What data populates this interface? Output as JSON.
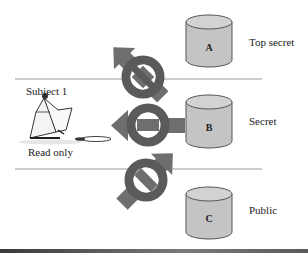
{
  "subject": {
    "name": "Subject 1",
    "mode": "Read only"
  },
  "levels": [
    {
      "name": "Top secret",
      "object": "A",
      "access": "denied",
      "direction": "down-left"
    },
    {
      "name": "Secret",
      "object": "B",
      "access": "allowed",
      "direction": "left"
    },
    {
      "name": "Public",
      "object": "C",
      "access": "allowed",
      "direction": "up-left"
    }
  ],
  "colors": {
    "arrow": "#6e6e6e",
    "ring": "#5a5a5a",
    "cylinder_fill": "#c4c4c4",
    "cylinder_top": "#d2d2d2",
    "divider": "#9a9a9a"
  }
}
